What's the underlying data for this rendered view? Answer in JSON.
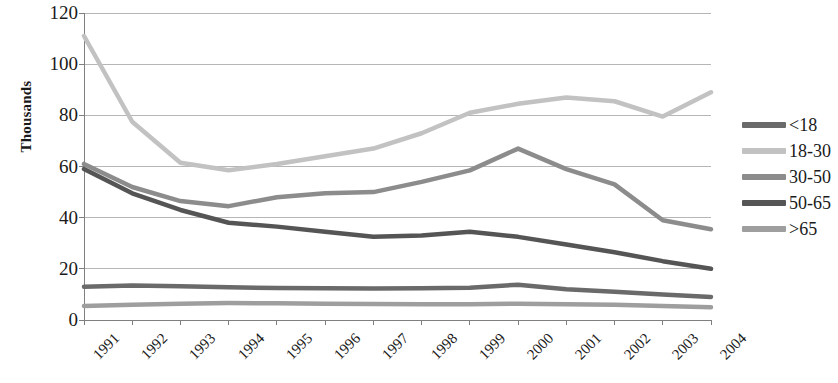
{
  "chart_data": {
    "type": "line",
    "title": "",
    "subtitle": "",
    "xlabel": "",
    "ylabel": "Thousands",
    "categories": [
      "1991",
      "1992",
      "1993",
      "1994",
      "1995",
      "1996",
      "1997",
      "1998",
      "1999",
      "2000",
      "2001",
      "2002",
      "2003",
      "2004"
    ],
    "ylim": [
      0,
      120
    ],
    "ytick_values": [
      0,
      20,
      40,
      60,
      80,
      100,
      120
    ],
    "ytick_labels": [
      "0",
      "20",
      "40",
      "60",
      "80",
      "100",
      "120"
    ],
    "grid": true,
    "grid_axis": "y",
    "legend_position": "right",
    "series": [
      {
        "name": "<18",
        "color": "#6a6a6a",
        "values": [
          13.0,
          13.5,
          13.2,
          12.8,
          12.5,
          12.4,
          12.3,
          12.4,
          12.6,
          13.8,
          12.0,
          11.0,
          10.0,
          9.0
        ]
      },
      {
        "name": "18-30",
        "color": "#c2c2c2",
        "values": [
          111.0,
          77.5,
          61.5,
          58.5,
          61.0,
          64.0,
          67.0,
          73.0,
          81.0,
          84.5,
          87.0,
          85.5,
          79.5,
          89.0
        ]
      },
      {
        "name": "30-50",
        "color": "#8c8c8c",
        "values": [
          61.0,
          52.0,
          46.5,
          44.5,
          48.0,
          49.5,
          50.0,
          54.0,
          58.5,
          67.0,
          59.0,
          53.0,
          39.0,
          35.5
        ]
      },
      {
        "name": "50-65",
        "color": "#555555",
        "values": [
          59.0,
          49.5,
          43.0,
          38.0,
          36.5,
          34.5,
          32.5,
          33.0,
          34.5,
          32.5,
          29.5,
          26.5,
          23.0,
          20.0
        ]
      },
      {
        "name": ">65",
        "color": "#9e9e9e",
        "values": [
          5.5,
          6.0,
          6.4,
          6.6,
          6.5,
          6.4,
          6.3,
          6.2,
          6.2,
          6.4,
          6.2,
          6.0,
          5.5,
          5.0
        ]
      }
    ]
  }
}
